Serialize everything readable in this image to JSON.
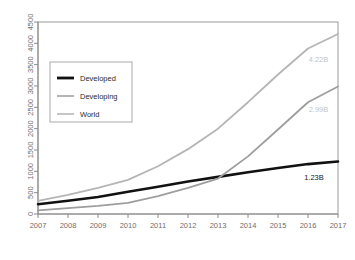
{
  "chart_data": {
    "type": "line",
    "title": "",
    "xlabel": "",
    "ylabel": "",
    "x": [
      2007,
      2008,
      2009,
      2010,
      2011,
      2012,
      2013,
      2014,
      2015,
      2016,
      2017
    ],
    "categories": [
      "2007",
      "2008",
      "2009",
      "2010",
      "2011",
      "2012",
      "2013",
      "2014",
      "2015",
      "2016",
      "2017"
    ],
    "xlim": [
      2007,
      2017
    ],
    "ylim": [
      0,
      4500
    ],
    "yticks": [
      0,
      500,
      1000,
      1500,
      2000,
      2500,
      3000,
      3500,
      4000,
      4500
    ],
    "ytick_labels": [
      "0",
      "500",
      "1000",
      "1500",
      "2000",
      "2500",
      "3000",
      "3500",
      "4000",
      "4500"
    ],
    "grid": false,
    "legend_position": "upper left",
    "series": [
      {
        "name": "Developed",
        "color": "#111111",
        "width": 2.6,
        "values": [
          230,
          310,
          400,
          520,
          640,
          760,
          870,
          980,
          1080,
          1170,
          1230
        ]
      },
      {
        "name": "Developing",
        "color": "#9e9e9e",
        "width": 1.8,
        "values": [
          85,
          140,
          190,
          260,
          420,
          610,
          830,
          1350,
          1980,
          2620,
          2990
        ]
      },
      {
        "name": "World",
        "color": "#b5b5b5",
        "width": 1.8,
        "values": [
          310,
          450,
          610,
          800,
          1120,
          1520,
          2000,
          2620,
          3270,
          3880,
          4220
        ]
      }
    ],
    "annotations": [
      {
        "label": "4.22B",
        "x": 2016.35,
        "y": 3560,
        "color": "#c3c3c3"
      },
      {
        "label": "2.99B",
        "x": 2016.35,
        "y": 2390,
        "color": "#c3c3c3"
      },
      {
        "label": "1.23B",
        "x": 2016.2,
        "y": 800,
        "color": "#1a1a1a"
      }
    ]
  },
  "legend": {
    "items": [
      {
        "label": "Developed",
        "color": "#111111",
        "width": 2.8
      },
      {
        "label": "Developing",
        "color": "#a3a3a3",
        "width": 1.6
      },
      {
        "label": "World",
        "color": "#b8b8b8",
        "width": 1.6
      }
    ]
  },
  "colors": {
    "developed": "#111111",
    "developing": "#9e9e9e",
    "world": "#b5b5b5",
    "axis": "#8a8a8a",
    "box": "#9a9a9a",
    "background": "#ffffff"
  }
}
